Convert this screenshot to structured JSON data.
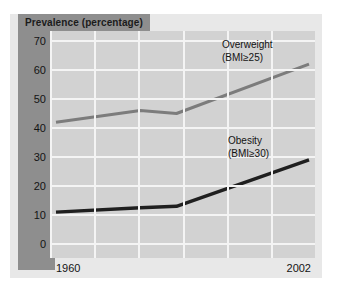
{
  "figure": {
    "title": "Prevalence (percentage)",
    "background_color": "#e8e8e8",
    "band_color": "#8e8e8e",
    "plot_color": "#d2d2d2",
    "grid_color": "#f4f4f4"
  },
  "chart_data": {
    "type": "line",
    "title": "Prevalence (percentage)",
    "xlabel": "",
    "ylabel": "Prevalence (percentage)",
    "xlim": [
      1960,
      2002
    ],
    "ylim": [
      0,
      70
    ],
    "yticks": [
      0,
      10,
      20,
      30,
      40,
      50,
      60,
      70
    ],
    "xticks": [
      1960,
      2002
    ],
    "xticklabels": [
      "1960",
      "2002"
    ],
    "yticklabels": [
      "0",
      "10",
      "20",
      "30",
      "40",
      "50",
      "60",
      "70"
    ],
    "grid": true,
    "legend": "inline-annotations",
    "x": [
      1960,
      1974,
      1980,
      2002
    ],
    "series": [
      {
        "name": "Overweight (BMI≥25)",
        "label_line1": "Overweight",
        "label_line2": "(BMI≥25)",
        "color": "#7c7c7c",
        "values": [
          42,
          46,
          45,
          62
        ]
      },
      {
        "name": "Obesity (BMI≥30)",
        "label_line1": "Obesity",
        "label_line2": "(BMI≥30)",
        "color": "#1f1f1f",
        "values": [
          11,
          12.5,
          13,
          29
        ]
      }
    ]
  }
}
